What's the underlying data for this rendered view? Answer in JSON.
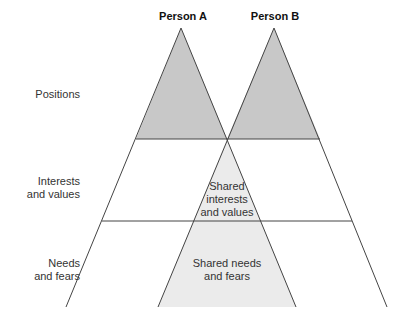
{
  "headers": {
    "person_a": "Person A",
    "person_b": "Person B"
  },
  "levels": {
    "positions": "Positions",
    "interests_line1": "Interests",
    "interests_line2": "and values",
    "needs_line1": "Needs",
    "needs_line2": "and fears"
  },
  "shared": {
    "interests_line1": "Shared",
    "interests_line2": "interests",
    "interests_line3": "and values",
    "needs_line1": "Shared needs",
    "needs_line2": "and fears"
  },
  "colors": {
    "positions_fill": "#c8c8c8",
    "shared_fill": "#ebebeb",
    "stroke": "#444444"
  }
}
